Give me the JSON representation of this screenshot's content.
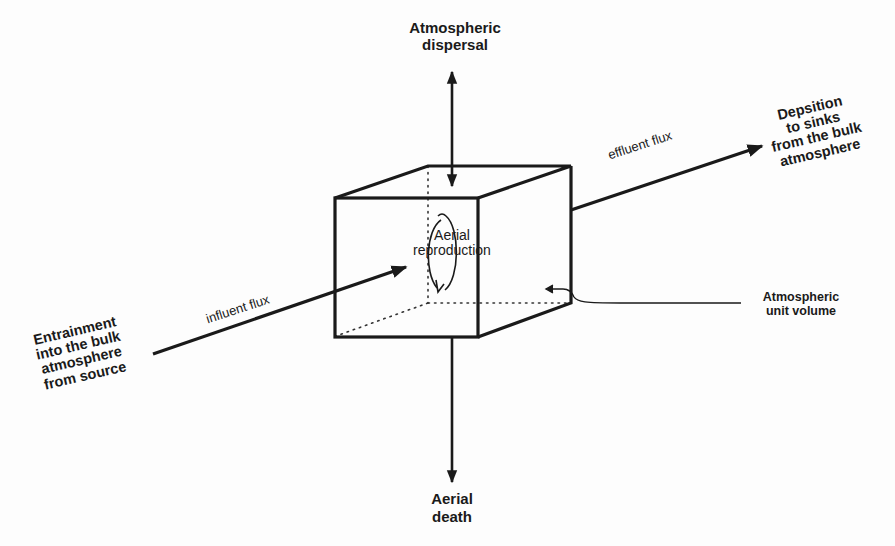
{
  "diagram": {
    "nodes": {
      "top": {
        "lines": [
          "Atmospheric",
          "dispersal"
        ]
      },
      "bottom": {
        "lines": [
          "Aerial",
          "death"
        ]
      },
      "right": {
        "lines": [
          "Depsition",
          "to sinks",
          "from the bulk",
          "atmosphere"
        ]
      },
      "left": {
        "lines": [
          "Entrainment",
          "into the  bulk",
          "atmosphere",
          "from source"
        ]
      },
      "center": {
        "lines": [
          "Aerial",
          "reproduction"
        ]
      },
      "volume_label": {
        "lines": [
          "Atmospheric",
          "unit volume"
        ]
      }
    },
    "edges": {
      "effluent": {
        "label": "effluent flux",
        "from": "center",
        "to": "right",
        "direction": "one-way"
      },
      "influent": {
        "label": "influent flux",
        "from": "left",
        "to": "center",
        "direction": "one-way"
      },
      "dispersal": {
        "label": "",
        "from": "center",
        "to": "top",
        "direction": "two-way"
      },
      "death": {
        "label": "",
        "from": "center",
        "to": "bottom",
        "direction": "one-way"
      }
    },
    "colors": {
      "ink": "#1a1a1a",
      "background": "#fdfdfd"
    }
  }
}
